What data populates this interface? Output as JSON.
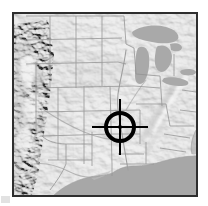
{
  "figure": {
    "kind": "locator-map",
    "background_color": "#ffffff",
    "width": 208,
    "height": 206
  },
  "map": {
    "name": "united-states-shaded-relief-map",
    "description": "Grayscale shaded relief map showing state boundaries, the Great Lakes, and the Gulf of Mexico",
    "frame": {
      "border_color": "#2e2e2e",
      "border_width_px": 2,
      "x": 12,
      "y": 12,
      "width": 186,
      "height": 185
    },
    "colors": {
      "land_base": "#e7e7e7",
      "land_light": "#f2f2f2",
      "land_shadow": "#c9c9c9",
      "terrain_highlight": "#fbfbfb",
      "terrain_dark": "#b4b4b4",
      "water": "#a8a8a8",
      "water_dark": "#9d9d9d",
      "boundary_line": "#8d8d8d",
      "river_line": "#9a9a9a",
      "marker": "#000000"
    },
    "features": [
      {
        "name": "great-lakes",
        "type": "water",
        "label": "Great Lakes"
      },
      {
        "name": "gulf-of-mexico",
        "type": "water",
        "label": "Gulf of Mexico"
      },
      {
        "name": "atlantic-ocean",
        "type": "water",
        "label": "Atlantic Ocean"
      },
      {
        "name": "rocky-mountains",
        "type": "terrain",
        "label": "Rocky Mountains"
      },
      {
        "name": "appalachian-mountains",
        "type": "terrain",
        "label": "Appalachian Mountains"
      },
      {
        "name": "mississippi-river",
        "type": "river",
        "label": "Mississippi River"
      },
      {
        "name": "state-boundaries",
        "type": "boundary",
        "label": "State boundaries"
      }
    ]
  },
  "marker": {
    "name": "crosshair-target",
    "style": "reticle",
    "color": "#000000",
    "center_x": 120,
    "center_y": 127,
    "circle_radius_px": 14,
    "circle_stroke_px": 4,
    "arm_length_px": 28,
    "arm_stroke_px": 2,
    "center_dot_radius_px": 2,
    "tooltip": "Selected location"
  }
}
